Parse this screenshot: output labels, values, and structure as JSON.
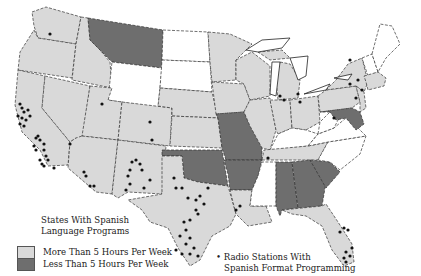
{
  "map": {
    "subject": "United States — Spanish language radio programming",
    "colors": {
      "more_than_5": "#d9d9d9",
      "less_than_5": "#6e6e6e",
      "none": "#ffffff",
      "station_dot": "#111111"
    },
    "states_more_than_5": [
      "Washington",
      "Oregon",
      "California",
      "Nevada",
      "Idaho",
      "Utah",
      "Arizona",
      "Colorado",
      "New Mexico",
      "Texas",
      "Nebraska",
      "Kansas",
      "Minnesota",
      "Iowa",
      "Wisconsin",
      "Illinois",
      "Michigan",
      "Indiana",
      "Ohio",
      "Pennsylvania",
      "New York",
      "New Jersey",
      "Connecticut",
      "Massachusetts",
      "Rhode Island",
      "Tennessee",
      "Louisiana",
      "Florida"
    ],
    "states_less_than_5": [
      "Montana",
      "Oklahoma",
      "Missouri",
      "Arkansas",
      "Alabama",
      "Georgia",
      "South Carolina",
      "Maryland",
      "Delaware"
    ],
    "states_none": [
      "Wyoming",
      "North Dakota",
      "South Dakota",
      "Kentucky",
      "West Virginia",
      "Virginia",
      "North Carolina",
      "Mississippi",
      "Maine",
      "New Hampshire",
      "Vermont"
    ]
  },
  "legend": {
    "title_line1": "States With Spanish",
    "title_line2": "Language Programs",
    "more_label": "More Than 5 Hours Per Week",
    "less_label": "Less Than  5 Hours Per Week",
    "radio_line1": "Radio Stations With",
    "radio_line2": "Spanish Format Programming"
  }
}
